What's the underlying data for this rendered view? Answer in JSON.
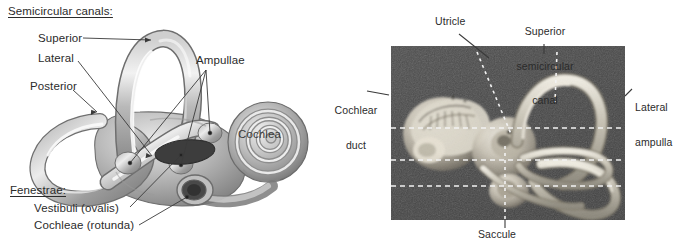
{
  "figure": {
    "background_color": "#ffffff",
    "text_color": "#2b2b2b"
  },
  "left_panel": {
    "type": "line-drawing",
    "description": "Shaded drawing of the right bony labyrinth, lateral view",
    "heading": "Semicircular canals:",
    "canal_labels": [
      {
        "label": "Superior",
        "x": 38,
        "y": 38
      },
      {
        "label": "Lateral",
        "x": 38,
        "y": 58
      },
      {
        "label": "Posterior",
        "x": 30,
        "y": 86
      }
    ],
    "ampullae_label": "Ampullae",
    "cochlea_label": "Cochlea",
    "fenestrae_heading": "Fenestrae:",
    "fenestrae_items": [
      "Vestibuli (ovalis)",
      "Cochleae (rotunda)"
    ],
    "leader_color": "#3a3a3a"
  },
  "right_panel": {
    "type": "photograph",
    "description": "Black and white photograph of a dissected membranous labyrinth specimen",
    "plate_background": "#4a4a4a",
    "leader_style": "white dashed",
    "leader_color": "#f2f2f2",
    "labels": [
      {
        "label": "Utricle",
        "lines": [
          "Utricle"
        ]
      },
      {
        "label": "Superior semicircular canal",
        "lines": [
          "Superior",
          "semicircular",
          "canal"
        ]
      },
      {
        "label": "Cochlear duct",
        "lines": [
          "Cochlear",
          "duct"
        ]
      },
      {
        "label": "Lateral ampulla",
        "lines": [
          "Lateral",
          "ampulla"
        ]
      },
      {
        "label": "Saccule",
        "lines": [
          "Saccule"
        ]
      }
    ]
  }
}
